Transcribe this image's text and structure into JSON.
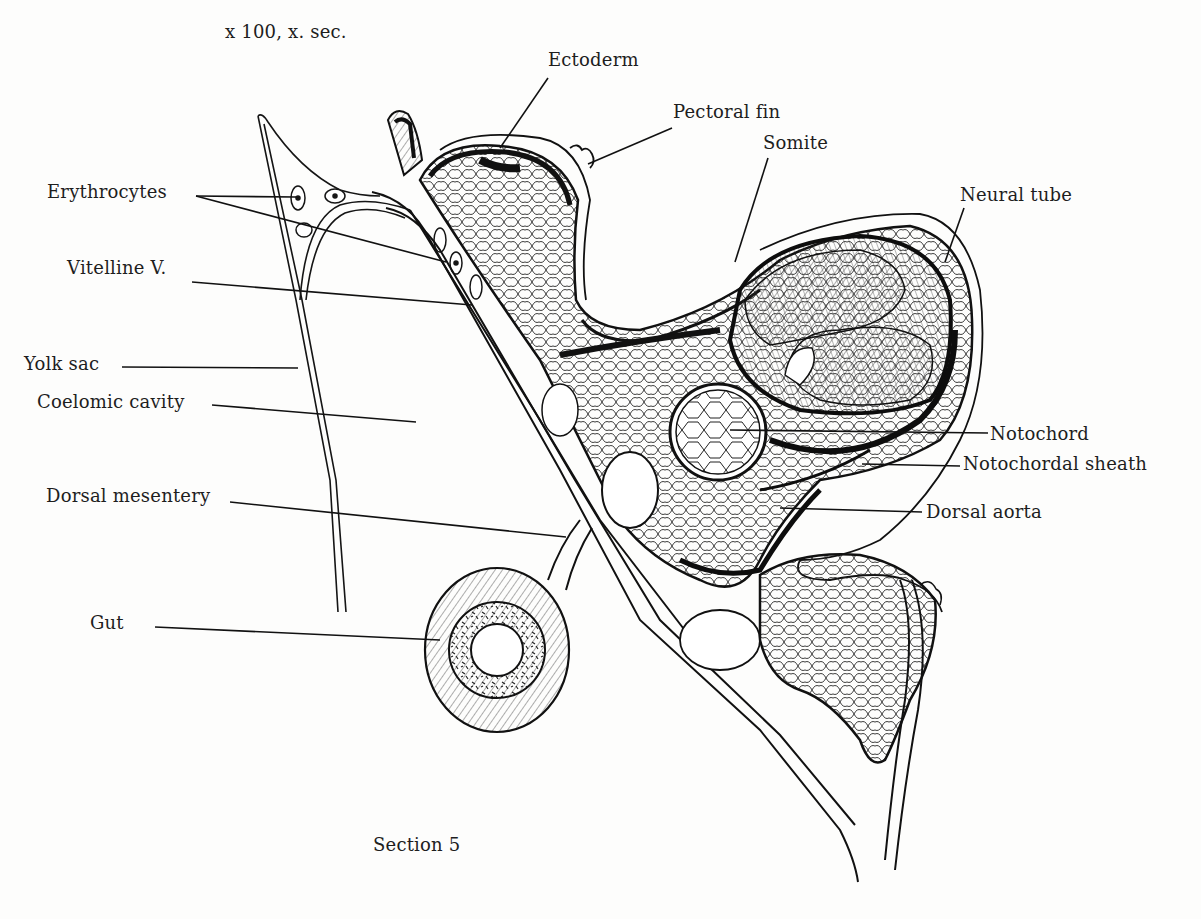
{
  "figure": {
    "magnification": "x 100, x. sec.",
    "caption": "Section 5",
    "ink_color": "#111111",
    "paper_color": "#fdfdfc"
  },
  "labels": [
    {
      "id": "ectoderm",
      "text": "Ectoderm",
      "x": 548,
      "y": 50,
      "line": [
        [
          548,
          78
        ],
        [
          500,
          148
        ]
      ]
    },
    {
      "id": "pectoral-fin",
      "text": "Pectoral fin",
      "x": 673,
      "y": 102,
      "line": [
        [
          672,
          128
        ],
        [
          588,
          164
        ]
      ]
    },
    {
      "id": "somite",
      "text": "Somite",
      "x": 763,
      "y": 133,
      "line": [
        [
          768,
          158
        ],
        [
          735,
          262
        ]
      ]
    },
    {
      "id": "neural-tube",
      "text": "Neural tube",
      "x": 960,
      "y": 185,
      "line": [
        [
          964,
          208
        ],
        [
          945,
          260
        ]
      ]
    },
    {
      "id": "erythrocytes",
      "text": "Erythrocytes",
      "x": 47,
      "y": 182,
      "line": [
        [
          196,
          196
        ],
        [
          296,
          197
        ]
      ],
      "line2": [
        [
          196,
          196
        ],
        [
          446,
          262
        ]
      ]
    },
    {
      "id": "vitelline-v",
      "text": "Vitelline V.",
      "x": 67,
      "y": 258,
      "line": [
        [
          192,
          282
        ],
        [
          472,
          305
        ]
      ]
    },
    {
      "id": "yolk-sac",
      "text": "Yolk sac",
      "x": 24,
      "y": 354,
      "line": [
        [
          122,
          367
        ],
        [
          298,
          368
        ]
      ]
    },
    {
      "id": "coelomic-cavity",
      "text": "Coelomic cavity",
      "x": 37,
      "y": 392,
      "line": [
        [
          212,
          405
        ],
        [
          416,
          422
        ]
      ]
    },
    {
      "id": "notochord",
      "text": "Notochord",
      "x": 990,
      "y": 424,
      "line": [
        [
          730,
          430
        ],
        [
          988,
          433
        ]
      ]
    },
    {
      "id": "notochordal-sheath",
      "text": "Notochordal sheath",
      "x": 963,
      "y": 454,
      "line": [
        [
          862,
          464
        ],
        [
          960,
          466
        ]
      ]
    },
    {
      "id": "dorsal-mesentery",
      "text": "Dorsal mesentery",
      "x": 46,
      "y": 486,
      "line": [
        [
          230,
          502
        ],
        [
          566,
          537
        ]
      ]
    },
    {
      "id": "dorsal-aorta",
      "text": "Dorsal aorta",
      "x": 926,
      "y": 502,
      "line": [
        [
          780,
          508
        ],
        [
          922,
          512
        ]
      ]
    },
    {
      "id": "gut",
      "text": "Gut",
      "x": 90,
      "y": 613,
      "line": [
        [
          155,
          627
        ],
        [
          440,
          640
        ]
      ]
    }
  ]
}
